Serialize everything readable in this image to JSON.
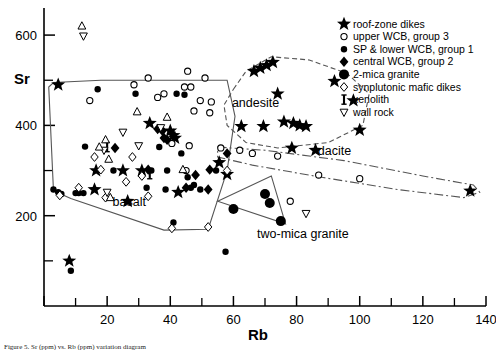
{
  "figure": {
    "caption": "Figure 5.  Sr (ppm) vs. Rb (ppm) variation diagram"
  },
  "chart_data": {
    "type": "scatter",
    "title": "",
    "xlabel": "Rb",
    "ylabel": "Sr",
    "xlim": [
      0,
      140
    ],
    "ylim": [
      0,
      660
    ],
    "grid": false,
    "xticks": [
      0,
      20,
      40,
      60,
      80,
      100,
      120,
      140
    ],
    "xtick_labels": [
      "",
      "20",
      "40",
      "60",
      "80",
      "100",
      "120",
      "140"
    ],
    "xminor": [
      10,
      30,
      50,
      70,
      90,
      110,
      130
    ],
    "yticks": [
      200,
      400,
      600
    ],
    "ytick_labels": [
      "200",
      "400",
      "600"
    ],
    "yminor": [
      100,
      300,
      500
    ],
    "legend_position": "top-right",
    "series": [
      {
        "name": "roof-zone dikes",
        "marker": "star-filled",
        "points": [
          [
            4.5,
            490
          ],
          [
            8.0,
            100
          ],
          [
            16.5,
            300
          ],
          [
            16.0,
            258
          ],
          [
            25.0,
            300
          ],
          [
            31.0,
            300
          ],
          [
            26.5,
            232
          ],
          [
            33.5,
            405
          ],
          [
            40.0,
            388
          ],
          [
            41.0,
            378
          ],
          [
            41.5,
            372
          ],
          [
            42.5,
            252
          ],
          [
            55.5,
            318
          ],
          [
            58.0,
            292
          ],
          [
            62.5,
            398
          ],
          [
            66.5,
            520
          ],
          [
            68.5,
            527
          ],
          [
            70.5,
            533
          ],
          [
            72.5,
            540
          ],
          [
            69.5,
            398
          ],
          [
            74.0,
            470
          ],
          [
            76.0,
            408
          ],
          [
            79.0,
            405
          ],
          [
            81.0,
            400
          ],
          [
            83.0,
            398
          ],
          [
            78.5,
            350
          ],
          [
            86.0,
            345
          ],
          [
            92.0,
            498
          ],
          [
            98.0,
            455
          ],
          [
            100.0,
            390
          ],
          [
            135.0,
            255
          ]
        ]
      },
      {
        "name": "upper WCB,  group 3",
        "marker": "circle-open",
        "points": [
          [
            14.5,
            455
          ],
          [
            28.5,
            490
          ],
          [
            33.0,
            505
          ],
          [
            36.0,
            462
          ],
          [
            38.0,
            470
          ],
          [
            44.5,
            485
          ],
          [
            46.5,
            485
          ],
          [
            45.5,
            520
          ],
          [
            51.0,
            505
          ],
          [
            49.5,
            455
          ],
          [
            53.0,
            452
          ],
          [
            47.5,
            432
          ],
          [
            52.5,
            428
          ],
          [
            40.5,
            360
          ],
          [
            46.0,
            355
          ],
          [
            56.0,
            350
          ],
          [
            62.0,
            345
          ],
          [
            45.0,
            300
          ],
          [
            66.0,
            338
          ],
          [
            74.0,
            332
          ],
          [
            87.0,
            290
          ],
          [
            100.0,
            282
          ],
          [
            78.0,
            232
          ]
        ]
      },
      {
        "name": "SP & lower WCB, group 1",
        "marker": "circle-filled",
        "points": [
          [
            3.0,
            258
          ],
          [
            4.5,
            252
          ],
          [
            5.5,
            248
          ],
          [
            8.5,
            78
          ],
          [
            10.0,
            250
          ],
          [
            11.0,
            250
          ],
          [
            12.5,
            250
          ],
          [
            13.0,
            353
          ],
          [
            17.0,
            480
          ],
          [
            22.0,
            300
          ],
          [
            29.0,
            470
          ],
          [
            32.5,
            262
          ],
          [
            34.0,
            300
          ],
          [
            36.5,
            352
          ],
          [
            38.5,
            258
          ],
          [
            39.0,
            300
          ],
          [
            42.0,
            470
          ],
          [
            44.5,
            468
          ],
          [
            41.0,
            185
          ],
          [
            43.5,
            338
          ],
          [
            45.5,
            285
          ],
          [
            46.5,
            262
          ],
          [
            47.5,
            268
          ],
          [
            49.5,
            258
          ],
          [
            54.5,
            300
          ],
          [
            57.5,
            120
          ]
        ]
      },
      {
        "name": "central WCB, group 2",
        "marker": "diamond-filled",
        "points": [
          [
            22.5,
            350
          ],
          [
            33.0,
            302
          ],
          [
            36.0,
            392
          ],
          [
            37.5,
            388
          ],
          [
            38.0,
            372
          ],
          [
            39.0,
            368
          ],
          [
            45.0,
            262
          ],
          [
            48.0,
            290
          ],
          [
            52.5,
            302
          ],
          [
            52.0,
            258
          ],
          [
            58.0,
            338
          ]
        ]
      },
      {
        "name": "2-mica granite",
        "marker": "circle-large-filled",
        "points": [
          [
            60.0,
            215
          ],
          [
            70.0,
            248
          ],
          [
            71.5,
            228
          ],
          [
            75.0,
            188
          ]
        ]
      },
      {
        "name": "synplutonic mafic dikes",
        "marker": "diamond-open",
        "points": [
          [
            5.0,
            245
          ],
          [
            11.0,
            262
          ],
          [
            16.0,
            330
          ],
          [
            18.0,
            302
          ],
          [
            19.5,
            240
          ],
          [
            26.0,
            275
          ],
          [
            28.0,
            330
          ],
          [
            31.0,
            288
          ],
          [
            33.0,
            243
          ],
          [
            40.5,
            172
          ],
          [
            52.0,
            175
          ],
          [
            58.0,
            300
          ]
        ]
      },
      {
        "name": "xenolith",
        "marker": "xenolith",
        "points": [
          [
            20.0,
            352
          ],
          [
            33.5,
            292
          ]
        ]
      },
      {
        "name": "wall rock",
        "marker": "triangle-down",
        "points": [
          [
            12.5,
            598
          ],
          [
            19.0,
            345
          ],
          [
            20.0,
            252
          ],
          [
            25.0,
            385
          ],
          [
            30.0,
            355
          ],
          [
            37.0,
            395
          ],
          [
            83.0,
            205
          ]
        ]
      },
      {
        "name": "wall rock (up)",
        "marker": "triangle-up",
        "points": [
          [
            12.0,
            620
          ],
          [
            17.5,
            352
          ],
          [
            19.5,
            368
          ],
          [
            20.5,
            325
          ],
          [
            21.0,
            240
          ],
          [
            29.5,
            430
          ],
          [
            39.0,
            418
          ],
          [
            44.0,
            302
          ]
        ]
      }
    ],
    "fields": [
      {
        "name": "basalt",
        "label": "basalt",
        "style": "solid",
        "label_xy": [
          27,
          222
        ],
        "vertices": [
          [
            1.5,
            485
          ],
          [
            3.0,
            255
          ],
          [
            8.5,
            238
          ],
          [
            38.0,
            168
          ],
          [
            52.0,
            170
          ],
          [
            58.0,
            300
          ],
          [
            60.5,
            420
          ],
          [
            58.0,
            500
          ],
          [
            18.0,
            500
          ],
          [
            3.0,
            495
          ]
        ]
      },
      {
        "name": "andesite",
        "label": "andesite",
        "style": "dashed",
        "label_xy": [
          67,
          440
        ],
        "vertices": [
          [
            60.0,
            480
          ],
          [
            64.0,
            520
          ],
          [
            72.0,
            552
          ],
          [
            84.0,
            545
          ],
          [
            96.0,
            515
          ],
          [
            103.0,
            470
          ],
          [
            101.0,
            400
          ],
          [
            90.0,
            362
          ],
          [
            74.0,
            350
          ],
          [
            64.0,
            362
          ],
          [
            58.0,
            400
          ],
          [
            57.0,
            445
          ]
        ]
      },
      {
        "name": "dacite",
        "label": "dacite",
        "style": "dashdot",
        "label_xy": [
          92,
          335
        ],
        "vertices": [
          [
            55.0,
            352
          ],
          [
            70.0,
            345
          ],
          [
            95.0,
            322
          ],
          [
            120.0,
            288
          ],
          [
            136.0,
            268
          ],
          [
            138.0,
            252
          ],
          [
            133.0,
            240
          ],
          [
            112.0,
            258
          ],
          [
            88.0,
            285
          ],
          [
            66.0,
            312
          ],
          [
            55.0,
            330
          ]
        ]
      },
      {
        "name": "two-mica granite",
        "label": "two-mica granite",
        "style": "solid",
        "label_xy": [
          82,
          150
        ],
        "vertices": [
          [
            55.0,
            232
          ],
          [
            72.0,
            288
          ],
          [
            76.5,
            182
          ],
          [
            55.0,
            232
          ]
        ]
      }
    ]
  },
  "legend": {
    "items": [
      {
        "label": "roof-zone  dikes",
        "marker": "star-filled"
      },
      {
        "label": "upper WCB,  group 3",
        "marker": "circle-open"
      },
      {
        "label": "SP & lower  WCB, group 1",
        "marker": "circle-filled"
      },
      {
        "label": "central  WCB, group 2",
        "marker": "diamond-filled"
      },
      {
        "label": "2-mica  granite",
        "marker": "circle-large-filled"
      },
      {
        "label": "synplutonic  mafic  dikes",
        "marker": "diamond-open"
      },
      {
        "label": "xenolith",
        "marker": "xenolith"
      },
      {
        "label": "wall rock",
        "marker": "triangle-down"
      }
    ]
  },
  "colors": {
    "ink": "#000000",
    "background": "#ffffff",
    "field_line": "#555555"
  }
}
